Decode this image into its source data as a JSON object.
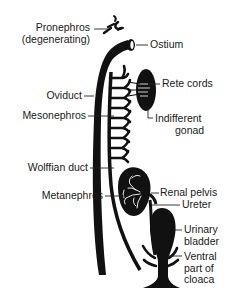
{
  "diagram": {
    "labels": {
      "pronephros_line1": "Pronephros",
      "pronephros_line2": "(degenerating)",
      "ostium": "Ostium",
      "rete_cords": "Rete cords",
      "oviduct": "Oviduct",
      "mesonephros": "Mesonephros",
      "indifferent_gonad_line1": "Indifferent",
      "indifferent_gonad_line2": "gonad",
      "wolffian_duct": "Wolffian duct",
      "metanephros": "Metanephros",
      "renal_pelvis": "Renal pelvis",
      "ureter": "Ureter",
      "urinary_bladder_line1": "Urinary",
      "urinary_bladder_line2": "bladder",
      "ventral_cloaca_line1": "Ventral",
      "ventral_cloaca_line2": "part of",
      "ventral_cloaca_line3": "cloaca"
    },
    "colors": {
      "ink": "#111111",
      "background": "#ffffff"
    }
  }
}
